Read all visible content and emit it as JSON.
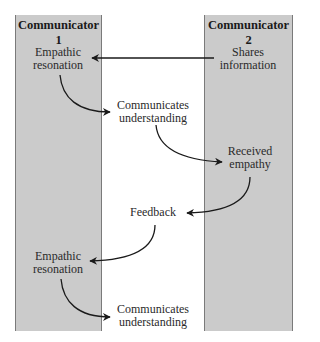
{
  "diagram": {
    "type": "communication-flow",
    "columns": [
      {
        "id": "communicator1",
        "title": "Communicator 1"
      },
      {
        "id": "communicator2",
        "title": "Communicator 2"
      }
    ],
    "nodes": [
      {
        "id": "n1",
        "label_line1": "Shares",
        "label_line2": "information",
        "column": "communicator2"
      },
      {
        "id": "n2",
        "label_line1": "Empathic",
        "label_line2": "resonation",
        "column": "communicator1"
      },
      {
        "id": "n3",
        "label_line1": "Communicates",
        "label_line2": "understanding",
        "column": "between"
      },
      {
        "id": "n4",
        "label_line1": "Received",
        "label_line2": "empathy",
        "column": "communicator2"
      },
      {
        "id": "n5",
        "label_line1": "Feedback",
        "label_line2": "",
        "column": "between"
      },
      {
        "id": "n6",
        "label_line1": "Empathic",
        "label_line2": "resonation",
        "column": "communicator1"
      },
      {
        "id": "n7",
        "label_line1": "Communicates",
        "label_line2": "understanding",
        "column": "between"
      }
    ],
    "edges": [
      {
        "from": "n1",
        "to": "n2",
        "style": "straight"
      },
      {
        "from": "n2",
        "to": "n3",
        "style": "curved"
      },
      {
        "from": "n3",
        "to": "n4",
        "style": "curved"
      },
      {
        "from": "n4",
        "to": "n5",
        "style": "curved"
      },
      {
        "from": "n5",
        "to": "n6",
        "style": "curved"
      },
      {
        "from": "n6",
        "to": "n7",
        "style": "curved"
      }
    ],
    "colors": {
      "column_fill": "#cbcbcb",
      "column_border": "#7a7a7a",
      "arrow": "#1a1a1a"
    }
  }
}
